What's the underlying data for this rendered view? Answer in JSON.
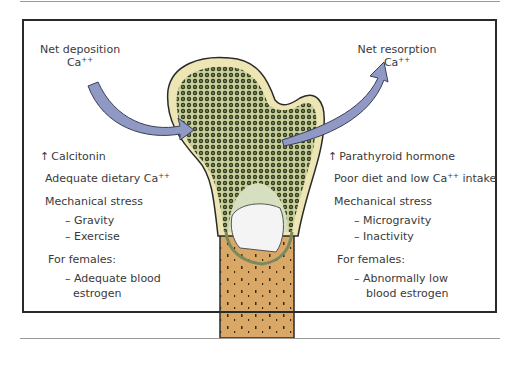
{
  "deposition": {
    "title": "Net deposition",
    "ion": "Ca",
    "charge": "++",
    "factors": {
      "hormone_prefix": "↑",
      "hormone": "Calcitonin",
      "diet": "Adequate dietary Ca",
      "diet_charge": "++",
      "stress_heading": "Mechanical stress",
      "stress_items": [
        "– Gravity",
        "– Exercise"
      ],
      "females_heading": "For females:",
      "females_items": [
        "– Adequate blood",
        "estrogen"
      ]
    }
  },
  "resorption": {
    "title": "Net resorption",
    "ion": "Ca",
    "charge": "++",
    "factors": {
      "hormone_prefix": "↑",
      "hormone": "Parathyroid hormone",
      "diet_a": "Poor diet and low Ca",
      "diet_charge": "++",
      "diet_b": " intake",
      "stress_heading": "Mechanical stress",
      "stress_items": [
        "– Microgravity",
        "– Inactivity"
      ],
      "females_heading": "For females:",
      "females_items": [
        "– Abnormally low",
        "blood estrogen"
      ]
    }
  },
  "colors": {
    "arrow": "#8f99c4",
    "bone_cortex": "#ede6b4",
    "spongy": "#2e3a1e",
    "marrow_cavity": "#d6dfc0",
    "shaft": "#d9a867",
    "cartilage": "#f4f4f4"
  }
}
